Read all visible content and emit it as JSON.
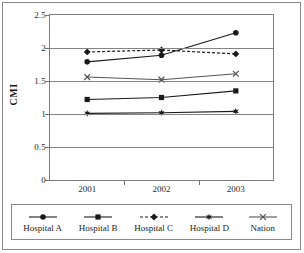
{
  "chart_data": {
    "type": "line",
    "title": "",
    "xlabel": "",
    "ylabel": "CMI",
    "categories": [
      "2001",
      "2002",
      "2003"
    ],
    "ylim": [
      0,
      2.5
    ],
    "ytick_labels": [
      "0",
      "0.5",
      "1",
      "1.5",
      "2",
      "2.5"
    ],
    "ytick_values": [
      0,
      0.5,
      1,
      1.5,
      2,
      2.5
    ],
    "grid": true,
    "legend_position": "bottom",
    "series": [
      {
        "name": "Hospital A",
        "marker": "circle",
        "line_style": "solid",
        "color": "#1a1a1a",
        "values": [
          1.79,
          1.89,
          2.23
        ]
      },
      {
        "name": "Hospital B",
        "marker": "square",
        "line_style": "solid",
        "color": "#1a1a1a",
        "values": [
          1.22,
          1.25,
          1.35
        ]
      },
      {
        "name": "Hospital C",
        "marker": "diamond",
        "line_style": "dashed",
        "color": "#1a1a1a",
        "values": [
          1.94,
          1.97,
          1.91
        ]
      },
      {
        "name": "Hospital D",
        "marker": "star",
        "line_style": "solid",
        "color": "#1a1a1a",
        "values": [
          1.01,
          1.02,
          1.04
        ]
      },
      {
        "name": "Nation",
        "marker": "cross",
        "line_style": "solid",
        "color": "#555555",
        "values": [
          1.56,
          1.52,
          1.61
        ]
      }
    ]
  },
  "axis": {
    "y_title": "CMI"
  }
}
